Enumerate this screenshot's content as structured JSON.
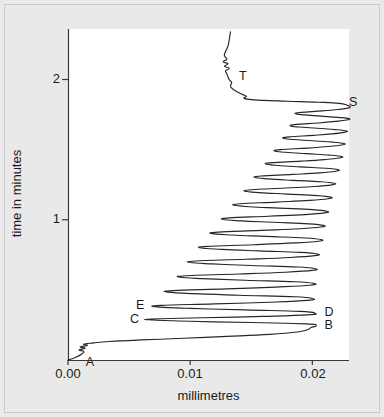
{
  "figure": {
    "background_color": "#e9e9e9",
    "plot_background_color": "#ffffff",
    "trace_color": "#262626",
    "axis_color": "#3a3a3a"
  },
  "chart_data": {
    "type": "line",
    "title": "",
    "xlabel": "millimetres",
    "ylabel": "time in minutes",
    "xlim": [
      0.0,
      0.023
    ],
    "ylim": [
      0.0,
      2.36
    ],
    "grid": false,
    "legend": null,
    "xticks": [
      0.0,
      0.01,
      0.02
    ],
    "xtick_labels": [
      "0.00",
      "0.01",
      "0.02"
    ],
    "yticks": [
      1,
      2
    ],
    "ytick_labels": [
      "1",
      "2"
    ],
    "annotations": [
      {
        "text": "A",
        "x": 0.0012,
        "y": 0.045,
        "anchor": "below-right"
      },
      {
        "text": "B",
        "x": 0.0205,
        "y": 0.245,
        "anchor": "right"
      },
      {
        "text": "C",
        "x": 0.0063,
        "y": 0.287,
        "anchor": "left"
      },
      {
        "text": "D",
        "x": 0.0205,
        "y": 0.337,
        "anchor": "right"
      },
      {
        "text": "E",
        "x": 0.0068,
        "y": 0.385,
        "anchor": "left"
      },
      {
        "text": "S",
        "x": 0.0225,
        "y": 1.835,
        "anchor": "right"
      },
      {
        "text": "T",
        "x": 0.0135,
        "y": 2.015,
        "anchor": "right"
      }
    ],
    "series": [
      {
        "name": "trace",
        "description": "Continuous recorded trace: initial rise from origin (A), rapid rightward excursion to B, then a long train of sawtooth oscillations of decreasing amplitude from C/D/E up to S, followed by a slow ascending tail through T to the top of the record.",
        "points": [
          [
            0.0,
            0.0
          ],
          [
            0.0006,
            0.018
          ],
          [
            0.0011,
            0.041
          ],
          [
            0.0013,
            0.06
          ],
          [
            0.0009,
            0.072
          ],
          [
            0.0014,
            0.083
          ],
          [
            0.001,
            0.094
          ],
          [
            0.0016,
            0.104
          ],
          [
            0.0013,
            0.113
          ],
          [
            0.0021,
            0.122
          ],
          [
            0.0034,
            0.132
          ],
          [
            0.006,
            0.143
          ],
          [
            0.0095,
            0.155
          ],
          [
            0.013,
            0.168
          ],
          [
            0.0165,
            0.183
          ],
          [
            0.0188,
            0.2
          ],
          [
            0.0196,
            0.216
          ],
          [
            0.0199,
            0.232
          ],
          [
            0.0203,
            0.245
          ],
          [
            0.0195,
            0.258
          ],
          [
            0.015,
            0.267
          ],
          [
            0.01,
            0.276
          ],
          [
            0.007,
            0.285
          ],
          [
            0.0068,
            0.292
          ],
          [
            0.011,
            0.301
          ],
          [
            0.016,
            0.311
          ],
          [
            0.0196,
            0.322
          ],
          [
            0.0202,
            0.334
          ],
          [
            0.019,
            0.347
          ],
          [
            0.0145,
            0.357
          ],
          [
            0.01,
            0.368
          ],
          [
            0.0073,
            0.379
          ],
          [
            0.0076,
            0.389
          ],
          [
            0.012,
            0.4
          ],
          [
            0.0165,
            0.412
          ],
          [
            0.0196,
            0.425
          ],
          [
            0.02,
            0.438
          ],
          [
            0.0186,
            0.451
          ],
          [
            0.014,
            0.462
          ],
          [
            0.0102,
            0.473
          ],
          [
            0.0082,
            0.484
          ],
          [
            0.0086,
            0.495
          ],
          [
            0.013,
            0.507
          ],
          [
            0.017,
            0.52
          ],
          [
            0.0198,
            0.533
          ],
          [
            0.0201,
            0.546
          ],
          [
            0.0186,
            0.558
          ],
          [
            0.0145,
            0.569
          ],
          [
            0.011,
            0.58
          ],
          [
            0.0092,
            0.59
          ],
          [
            0.0097,
            0.601
          ],
          [
            0.014,
            0.613
          ],
          [
            0.0178,
            0.626
          ],
          [
            0.02,
            0.639
          ],
          [
            0.0202,
            0.651
          ],
          [
            0.0188,
            0.663
          ],
          [
            0.015,
            0.674
          ],
          [
            0.0118,
            0.685
          ],
          [
            0.01,
            0.695
          ],
          [
            0.0105,
            0.706
          ],
          [
            0.0145,
            0.718
          ],
          [
            0.0182,
            0.731
          ],
          [
            0.0202,
            0.744
          ],
          [
            0.0204,
            0.756
          ],
          [
            0.019,
            0.767
          ],
          [
            0.0156,
            0.778
          ],
          [
            0.0126,
            0.789
          ],
          [
            0.0109,
            0.799
          ],
          [
            0.0114,
            0.81
          ],
          [
            0.0152,
            0.822
          ],
          [
            0.0186,
            0.835
          ],
          [
            0.0205,
            0.847
          ],
          [
            0.0207,
            0.859
          ],
          [
            0.0194,
            0.87
          ],
          [
            0.0162,
            0.881
          ],
          [
            0.0134,
            0.891
          ],
          [
            0.0118,
            0.901
          ],
          [
            0.0123,
            0.912
          ],
          [
            0.0158,
            0.924
          ],
          [
            0.019,
            0.936
          ],
          [
            0.0207,
            0.948
          ],
          [
            0.0209,
            0.96
          ],
          [
            0.0197,
            0.971
          ],
          [
            0.0168,
            0.982
          ],
          [
            0.0142,
            0.992
          ],
          [
            0.0127,
            1.002
          ],
          [
            0.0132,
            1.013
          ],
          [
            0.0164,
            1.025
          ],
          [
            0.0194,
            1.037
          ],
          [
            0.021,
            1.049
          ],
          [
            0.0212,
            1.061
          ],
          [
            0.02,
            1.072
          ],
          [
            0.0173,
            1.083
          ],
          [
            0.0149,
            1.093
          ],
          [
            0.0136,
            1.103
          ],
          [
            0.0141,
            1.114
          ],
          [
            0.0171,
            1.126
          ],
          [
            0.0198,
            1.138
          ],
          [
            0.0213,
            1.15
          ],
          [
            0.0215,
            1.161
          ],
          [
            0.0204,
            1.172
          ],
          [
            0.0179,
            1.183
          ],
          [
            0.0157,
            1.193
          ],
          [
            0.0145,
            1.203
          ],
          [
            0.015,
            1.214
          ],
          [
            0.0178,
            1.226
          ],
          [
            0.0202,
            1.237
          ],
          [
            0.0216,
            1.249
          ],
          [
            0.0218,
            1.26
          ],
          [
            0.0207,
            1.271
          ],
          [
            0.0184,
            1.281
          ],
          [
            0.0164,
            1.291
          ],
          [
            0.0153,
            1.301
          ],
          [
            0.0158,
            1.312
          ],
          [
            0.0184,
            1.323
          ],
          [
            0.0206,
            1.334
          ],
          [
            0.0219,
            1.346
          ],
          [
            0.0221,
            1.357
          ],
          [
            0.0211,
            1.367
          ],
          [
            0.019,
            1.377
          ],
          [
            0.0172,
            1.387
          ],
          [
            0.0162,
            1.397
          ],
          [
            0.0167,
            1.407
          ],
          [
            0.0191,
            1.418
          ],
          [
            0.021,
            1.429
          ],
          [
            0.0222,
            1.44
          ],
          [
            0.0224,
            1.451
          ],
          [
            0.0214,
            1.461
          ],
          [
            0.0195,
            1.471
          ],
          [
            0.0178,
            1.481
          ],
          [
            0.0169,
            1.49
          ],
          [
            0.0174,
            1.5
          ],
          [
            0.0196,
            1.511
          ],
          [
            0.0213,
            1.522
          ],
          [
            0.0224,
            1.533
          ],
          [
            0.0226,
            1.543
          ],
          [
            0.0217,
            1.553
          ],
          [
            0.02,
            1.563
          ],
          [
            0.0184,
            1.572
          ],
          [
            0.0176,
            1.581
          ],
          [
            0.0181,
            1.591
          ],
          [
            0.0201,
            1.602
          ],
          [
            0.0216,
            1.612
          ],
          [
            0.0226,
            1.623
          ],
          [
            0.0228,
            1.633
          ],
          [
            0.0219,
            1.643
          ],
          [
            0.0204,
            1.652
          ],
          [
            0.0189,
            1.661
          ],
          [
            0.0182,
            1.67
          ],
          [
            0.0187,
            1.68
          ],
          [
            0.0205,
            1.69
          ],
          [
            0.0219,
            1.701
          ],
          [
            0.0228,
            1.711
          ],
          [
            0.023,
            1.721
          ],
          [
            0.0221,
            1.73
          ],
          [
            0.0207,
            1.739
          ],
          [
            0.0193,
            1.748
          ],
          [
            0.0186,
            1.757
          ],
          [
            0.0191,
            1.766
          ],
          [
            0.0208,
            1.776
          ],
          [
            0.0221,
            1.786
          ],
          [
            0.0229,
            1.796
          ],
          [
            0.0231,
            1.806
          ],
          [
            0.0228,
            1.818
          ],
          [
            0.0222,
            1.83
          ],
          [
            0.0205,
            1.838
          ],
          [
            0.018,
            1.845
          ],
          [
            0.016,
            1.851
          ],
          [
            0.0148,
            1.858
          ],
          [
            0.0144,
            1.868
          ],
          [
            0.0146,
            1.88
          ],
          [
            0.0143,
            1.892
          ],
          [
            0.014,
            1.905
          ],
          [
            0.0137,
            1.92
          ],
          [
            0.0134,
            1.938
          ],
          [
            0.0133,
            1.958
          ],
          [
            0.0134,
            1.978
          ],
          [
            0.0132,
            1.998
          ],
          [
            0.0131,
            2.018
          ],
          [
            0.013,
            2.04
          ],
          [
            0.0129,
            2.062
          ],
          [
            0.0132,
            2.08
          ],
          [
            0.0128,
            2.095
          ],
          [
            0.0131,
            2.112
          ],
          [
            0.0127,
            2.126
          ],
          [
            0.013,
            2.145
          ],
          [
            0.0128,
            2.17
          ],
          [
            0.0129,
            2.2
          ],
          [
            0.0131,
            2.24
          ],
          [
            0.0132,
            2.285
          ],
          [
            0.0133,
            2.34
          ]
        ]
      }
    ]
  }
}
